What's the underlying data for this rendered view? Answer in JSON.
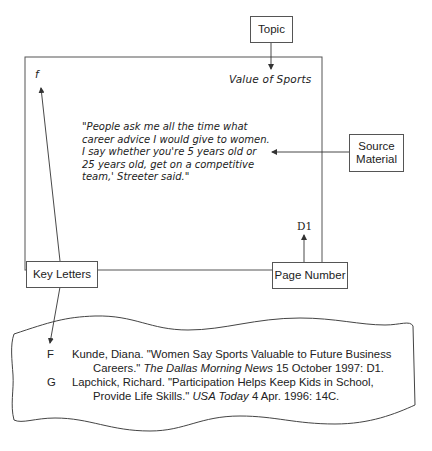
{
  "callouts": {
    "topic": "Topic",
    "source_material_line1": "Source",
    "source_material_line2": "Material",
    "page_number": "Page Number",
    "key_letters": "Key Letters"
  },
  "note_card": {
    "key_letter": "f",
    "topic": "Value of Sports",
    "quote_lines": [
      "\"People ask me all the time what",
      "career advice I would give to women.",
      "I say whether you're 5 years old or",
      "25 years old, get on a competitive",
      "team,' Streeter said.\""
    ],
    "page": "D1"
  },
  "bibliography": [
    {
      "key": "F",
      "line1_text": "Kunde, Diana. \"Women Say Sports Valuable to Future Business",
      "line2_pre": "Careers.\" ",
      "line2_italic": "The Dallas Morning News",
      "line2_post": " 15 October 1997: D1."
    },
    {
      "key": "G",
      "line1_text": "Lapchick, Richard. \"Participation Helps Keep Kids in School,",
      "line2_pre": "Provide Life Skills.\" ",
      "line2_italic": "USA Today",
      "line2_post": " 4 Apr. 1996: 14C."
    }
  ]
}
